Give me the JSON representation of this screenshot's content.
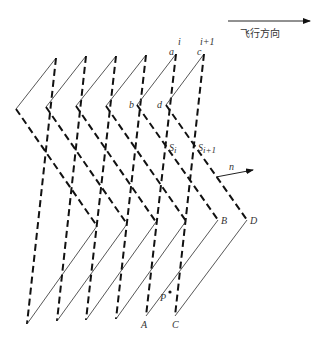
{
  "figure": {
    "flight_direction_label": "飞行方向",
    "labels": {
      "i": "i",
      "i_plus_1": "i+1",
      "a": "a",
      "b": "b",
      "c": "c",
      "d": "d",
      "S_i_base": "S",
      "S_i_sub": "i",
      "S_i1_base": "S",
      "S_i1_sub": "i+1",
      "n": "n",
      "A": "A",
      "B": "B",
      "C": "C",
      "D": "D",
      "P": "P"
    },
    "units": [
      {
        "left": [
          16,
          109
        ],
        "top": [
          56,
          58
        ],
        "bottom": [
          27,
          324
        ],
        "right": [
          97,
          226
        ]
      },
      {
        "left": [
          46,
          107
        ],
        "top": [
          86,
          56
        ],
        "bottom": [
          57,
          321
        ],
        "right": [
          127,
          224
        ]
      },
      {
        "left": [
          76,
          106
        ],
        "top": [
          116,
          56
        ],
        "bottom": [
          86,
          320
        ],
        "right": [
          156,
          222
        ]
      },
      {
        "left": [
          106,
          106
        ],
        "top": [
          146,
          55
        ],
        "bottom": [
          116,
          319
        ],
        "right": [
          186,
          221
        ]
      },
      {
        "left": [
          137,
          105
        ],
        "top": [
          176,
          54
        ],
        "bottom": [
          146,
          316
        ],
        "right": [
          218,
          220
        ]
      },
      {
        "left": [
          166,
          105
        ],
        "top": [
          204,
          54
        ],
        "bottom": [
          175,
          316
        ],
        "right": [
          247,
          220
        ]
      }
    ],
    "colors": {
      "solid_line": "#444444",
      "dashed_line": "#111111",
      "text": "#333333"
    }
  }
}
